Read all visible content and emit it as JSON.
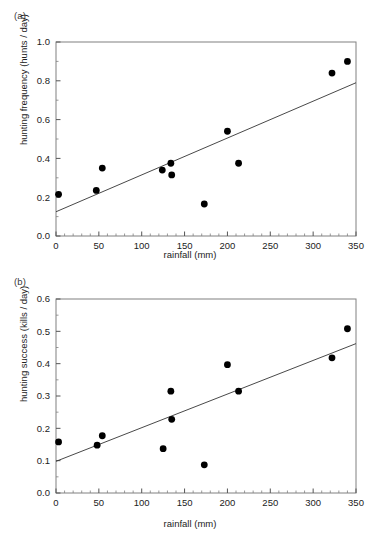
{
  "figure": {
    "panels": [
      {
        "label": "(a)",
        "chart_ref": 0
      },
      {
        "label": "(b)",
        "chart_ref": 1
      }
    ]
  },
  "chart_data": [
    {
      "type": "scatter",
      "panel": "(a)",
      "title": "",
      "xlabel": "rainfall (mm)",
      "ylabel": "hunting frequency (hunts / day)",
      "xlim": [
        0,
        350
      ],
      "ylim": [
        0.0,
        1.0
      ],
      "xticks": [
        0,
        50,
        100,
        150,
        200,
        250,
        300,
        350
      ],
      "xticklabels": [
        "0",
        "50",
        "100",
        "150",
        "200",
        "250",
        "300",
        "350"
      ],
      "yticks": [
        0.0,
        0.2,
        0.4,
        0.6,
        0.8,
        1.0
      ],
      "yticklabels": [
        "0.0",
        "0.2",
        "0.4",
        "0.6",
        "0.8",
        "1.0"
      ],
      "x_minor_step": 10,
      "grid": false,
      "legend": "none",
      "marker": "filled-circle",
      "marker_color": "#000000",
      "points": [
        {
          "x": 3,
          "y": 0.215
        },
        {
          "x": 47,
          "y": 0.235
        },
        {
          "x": 54,
          "y": 0.35
        },
        {
          "x": 124,
          "y": 0.34
        },
        {
          "x": 134,
          "y": 0.375
        },
        {
          "x": 135,
          "y": 0.315
        },
        {
          "x": 173,
          "y": 0.165
        },
        {
          "x": 200,
          "y": 0.54
        },
        {
          "x": 213,
          "y": 0.375
        },
        {
          "x": 322,
          "y": 0.84
        },
        {
          "x": 340,
          "y": 0.9
        }
      ],
      "fit_line": {
        "type": "linear-regression",
        "x_start": 0,
        "y_start": 0.125,
        "x_end": 350,
        "y_end": 0.79,
        "color": "#333333"
      }
    },
    {
      "type": "scatter",
      "panel": "(b)",
      "title": "",
      "xlabel": "rainfall (mm)",
      "ylabel": "hunting success (kills / day)",
      "xlim": [
        0,
        350
      ],
      "ylim": [
        0.0,
        0.6
      ],
      "xticks": [
        0,
        50,
        100,
        150,
        200,
        250,
        300,
        350
      ],
      "xticklabels": [
        "0",
        "50",
        "100",
        "150",
        "200",
        "250",
        "300",
        "350"
      ],
      "yticks": [
        0.0,
        0.1,
        0.2,
        0.3,
        0.4,
        0.5,
        0.6
      ],
      "yticklabels": [
        "0.0",
        "0.1",
        "0.2",
        "0.3",
        "0.4",
        "0.5",
        "0.6"
      ],
      "x_minor_step": 10,
      "grid": false,
      "legend": "none",
      "marker": "filled-circle",
      "marker_color": "#000000",
      "points": [
        {
          "x": 3,
          "y": 0.158
        },
        {
          "x": 48,
          "y": 0.148
        },
        {
          "x": 54,
          "y": 0.177
        },
        {
          "x": 125,
          "y": 0.137
        },
        {
          "x": 134,
          "y": 0.315
        },
        {
          "x": 135,
          "y": 0.228
        },
        {
          "x": 173,
          "y": 0.087
        },
        {
          "x": 200,
          "y": 0.397
        },
        {
          "x": 213,
          "y": 0.315
        },
        {
          "x": 322,
          "y": 0.418
        },
        {
          "x": 340,
          "y": 0.508
        }
      ],
      "fit_line": {
        "type": "linear-regression",
        "x_start": 0,
        "y_start": 0.098,
        "x_end": 350,
        "y_end": 0.462,
        "color": "#333333"
      }
    }
  ]
}
